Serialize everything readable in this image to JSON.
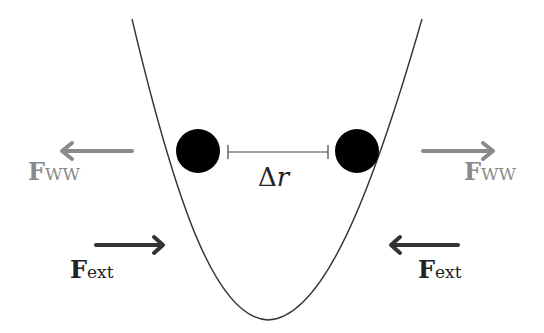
{
  "diagram": {
    "type": "potential-well",
    "colors": {
      "ww": "#8a8a8a",
      "ext": "#333333",
      "ball": "#000000",
      "curve": "#333333"
    },
    "delta_label": {
      "symbol": "Δ",
      "var": "r"
    },
    "labels": {
      "ww_left": {
        "main": "F",
        "sub": "WW"
      },
      "ww_right": {
        "main": "F",
        "sub": "WW"
      },
      "ext_left": {
        "main": "F",
        "sub": "ext"
      },
      "ext_right": {
        "main": "F",
        "sub": "ext"
      }
    }
  }
}
